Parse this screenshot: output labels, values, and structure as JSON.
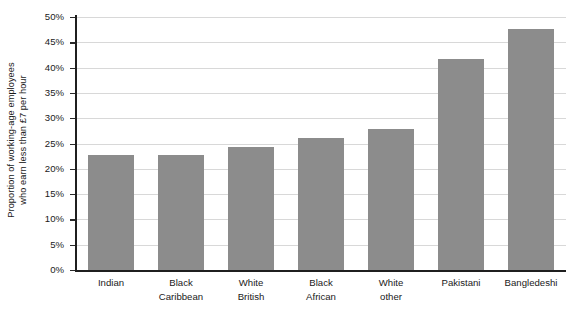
{
  "chart_data": {
    "type": "bar",
    "title": "",
    "xlabel": "",
    "ylabel": "Proportion of working-age employees who earn less than £7 per hour",
    "ylabel_lines": [
      "Proportion of working-age employees",
      "who earn less than £7 per hour"
    ],
    "categories": [
      "Indian",
      "Black Caribbean",
      "White British",
      "Black African",
      "White other",
      "Pakistani",
      "Bangledeshi"
    ],
    "category_lines": [
      [
        "Indian"
      ],
      [
        "Black",
        "Caribbean"
      ],
      [
        "White",
        "British"
      ],
      [
        "Black",
        "African"
      ],
      [
        "White",
        "other"
      ],
      [
        "Pakistani"
      ],
      [
        "Bangledeshi"
      ]
    ],
    "values": [
      22.8,
      22.7,
      24.4,
      26.0,
      27.9,
      41.8,
      47.6
    ],
    "value_unit": "%",
    "ylim": [
      0,
      50
    ],
    "ytick_step": 5,
    "ytick_labels": [
      "50%",
      "45%",
      "40%",
      "35%",
      "30%",
      "25%",
      "20%",
      "15%",
      "10%",
      "5%",
      "0%"
    ],
    "ytick_values": [
      50,
      45,
      40,
      35,
      30,
      25,
      20,
      15,
      10,
      5,
      0
    ],
    "grid": true,
    "grid_axis": "y",
    "legend": false,
    "legend_position": "none",
    "series": [
      {
        "name": "Proportion earning less than £7 per hour",
        "values": [
          22.8,
          22.7,
          24.4,
          26.0,
          27.9,
          41.8,
          47.6
        ]
      }
    ],
    "colors": {
      "bar_fill": "#8c8c8c",
      "grid_line": "#d8d8d8",
      "axis_line": "#1f1f1f",
      "text": "#1a1a1a",
      "background": "#ffffff"
    }
  }
}
